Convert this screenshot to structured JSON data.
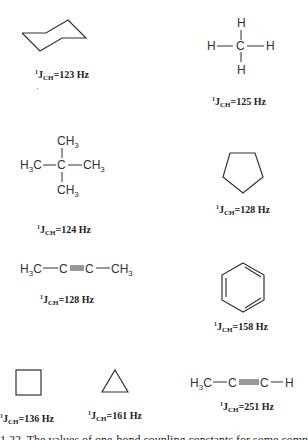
{
  "figure": {
    "molecules": [
      {
        "id": "cyclohexane",
        "structure": "chair ring",
        "label": {
          "sup": "1",
          "J": "J",
          "sub": "CH",
          "value": "=123 Hz"
        }
      },
      {
        "id": "methane",
        "structure": "CH4",
        "atoms": {
          "center": "C",
          "top": "H",
          "bottom": "H",
          "left": "H",
          "right": "H"
        },
        "label": {
          "sup": "1",
          "J": "J",
          "sub": "CH",
          "value": "=125 Hz"
        }
      },
      {
        "id": "isobutane",
        "structure": "C(CH3)4",
        "atoms": {
          "center": "C",
          "top": "CH3",
          "bottom": "CH3",
          "left": "H3C",
          "right": "CH3"
        },
        "label": {
          "sup": "1",
          "J": "J",
          "sub": "CH",
          "value": "=124 Hz"
        }
      },
      {
        "id": "cyclopentane",
        "structure": "pentagon",
        "label": {
          "sup": "1",
          "J": "J",
          "sub": "CH",
          "value": "=128 Hz"
        }
      },
      {
        "id": "2-butyne",
        "structure": "H3C-C≡C-CH3",
        "atoms": [
          "H3C",
          "C",
          "C",
          "CH3"
        ],
        "label": {
          "sup": "1",
          "J": "J",
          "sub": "CH",
          "value": "=128 Hz"
        }
      },
      {
        "id": "benzene",
        "structure": "hexagon with alternating double bonds",
        "label": {
          "sup": "1",
          "J": "J",
          "sub": "CH",
          "value": "=158 Hz"
        }
      },
      {
        "id": "cyclobutane",
        "structure": "square",
        "label": {
          "sup": "1",
          "J": "J",
          "sub": "CH",
          "value": "=136 Hz"
        }
      },
      {
        "id": "cyclopropane",
        "structure": "triangle",
        "label": {
          "sup": "1",
          "J": "J",
          "sub": "CH",
          "value": "=161 Hz"
        }
      },
      {
        "id": "propyne",
        "structure": "H3C-C≡C-H",
        "atoms": [
          "H3C",
          "C",
          "C",
          "H"
        ],
        "label": {
          "sup": "1",
          "J": "J",
          "sub": "CH",
          "value": "=251 Hz"
        }
      }
    ],
    "caption": "1.22. The values of one-bond coupling constants for some compounds"
  }
}
